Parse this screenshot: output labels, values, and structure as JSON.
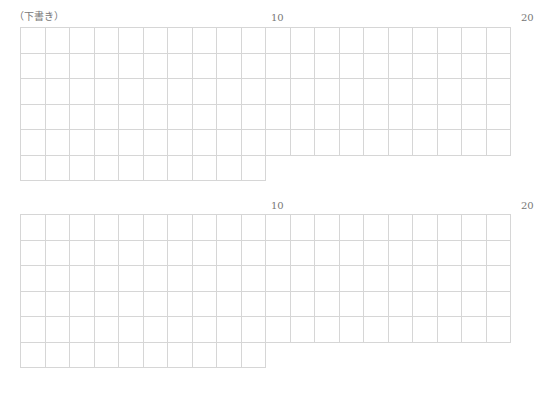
{
  "draft_label": "（下書き）",
  "sheets": [
    {
      "markers": {
        "col10": "10",
        "col20": "20"
      },
      "columns": 20,
      "full_rows": 5,
      "partial_row_columns": 10
    },
    {
      "markers": {
        "col10": "10",
        "col20": "20"
      },
      "columns": 20,
      "full_rows": 5,
      "partial_row_columns": 10
    }
  ],
  "colors": {
    "grid_line": "#d6d6d6",
    "text": "#777777",
    "background": "#ffffff"
  }
}
